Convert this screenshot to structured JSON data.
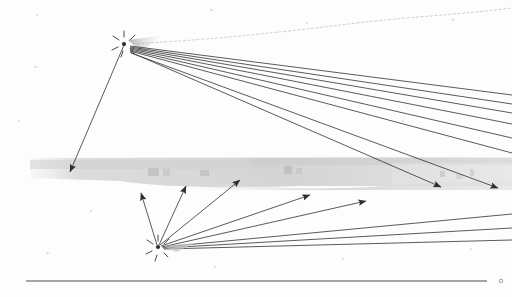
{
  "document": {
    "kind": "scanned-line-drawing",
    "title": "Ray diagram scan",
    "background_color": "#fdfdfd",
    "ink_color": "#3a3a3a",
    "faint_ink_color": "#b9b9b9",
    "band_color": "#d8d8d8",
    "canvas": {
      "width": 512,
      "height": 297
    }
  },
  "chart_data": {
    "type": "scatter",
    "xlabel": "",
    "ylabel": "",
    "xlim": [
      0,
      512
    ],
    "ylim": [
      0,
      297
    ],
    "grid": false,
    "legend": null,
    "nodes": [
      {
        "id": "upper-node",
        "label": "upper source node",
        "x": 124,
        "y": 43,
        "marker": "dashed-burst"
      },
      {
        "id": "lower-node",
        "label": "lower source node",
        "x": 158,
        "y": 247,
        "marker": "dashed-burst"
      }
    ],
    "annotations": [
      {
        "id": "gray-band",
        "label": "gray scan band",
        "x0": 30,
        "y0": 157,
        "x1": 512,
        "y1": 186
      },
      {
        "id": "baseline",
        "label": "horizontal baseline rule",
        "x0": 26,
        "y0": 281,
        "x1": 500,
        "y1": 281
      },
      {
        "id": "baseline-end-dot",
        "label": "baseline end marker",
        "x": 501,
        "y": 281
      }
    ],
    "series": [
      {
        "name": "upper-node-rays",
        "origin": {
          "x": 124,
          "y": 43
        },
        "values": [
          {
            "x": 70,
            "y": 172,
            "arrow": true,
            "weight": 1.0
          },
          {
            "x": 512,
            "y": 95,
            "arrow": false,
            "weight": 1.0
          },
          {
            "x": 512,
            "y": 104,
            "arrow": false,
            "weight": 1.0
          },
          {
            "x": 512,
            "y": 113,
            "arrow": false,
            "weight": 1.0
          },
          {
            "x": 512,
            "y": 124,
            "arrow": false,
            "weight": 1.0
          },
          {
            "x": 512,
            "y": 138,
            "arrow": false,
            "weight": 1.0
          },
          {
            "x": 512,
            "y": 153,
            "arrow": false,
            "weight": 1.0
          },
          {
            "x": 441,
            "y": 187,
            "arrow": true,
            "weight": 1.0
          },
          {
            "x": 498,
            "y": 188,
            "arrow": true,
            "weight": 1.0
          },
          {
            "x": 512,
            "y": 28,
            "arrow": false,
            "weight": 0.25
          }
        ]
      },
      {
        "name": "lower-node-rays",
        "origin": {
          "x": 158,
          "y": 247
        },
        "values": [
          {
            "x": 141,
            "y": 193,
            "arrow": true,
            "weight": 1.0
          },
          {
            "x": 186,
            "y": 186,
            "arrow": true,
            "weight": 1.0
          },
          {
            "x": 240,
            "y": 180,
            "arrow": true,
            "weight": 1.0
          },
          {
            "x": 310,
            "y": 195,
            "arrow": true,
            "weight": 1.0
          },
          {
            "x": 366,
            "y": 201,
            "arrow": true,
            "weight": 1.0
          },
          {
            "x": 512,
            "y": 214,
            "arrow": false,
            "weight": 1.0
          },
          {
            "x": 512,
            "y": 228,
            "arrow": false,
            "weight": 1.0
          },
          {
            "x": 512,
            "y": 240,
            "arrow": false,
            "weight": 1.0
          }
        ]
      }
    ]
  }
}
